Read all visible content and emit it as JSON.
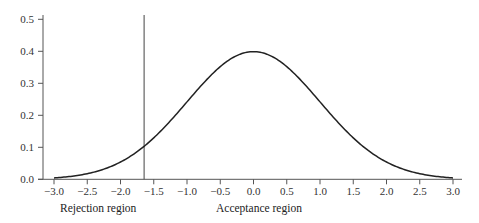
{
  "chart_data": {
    "type": "line",
    "title": "",
    "xlabel": "",
    "ylabel": "",
    "series": [
      {
        "name": "Standard normal pdf",
        "function": "exp(-x^2/2)/sqrt(2*pi)",
        "x_range": [
          -3.0,
          3.0
        ],
        "sample_points": [
          {
            "x": -3.0,
            "y": 0.004
          },
          {
            "x": -2.5,
            "y": 0.018
          },
          {
            "x": -2.0,
            "y": 0.054
          },
          {
            "x": -1.645,
            "y": 0.103
          },
          {
            "x": -1.5,
            "y": 0.13
          },
          {
            "x": -1.0,
            "y": 0.242
          },
          {
            "x": -0.5,
            "y": 0.352
          },
          {
            "x": 0.0,
            "y": 0.399
          },
          {
            "x": 0.5,
            "y": 0.352
          },
          {
            "x": 1.0,
            "y": 0.242
          },
          {
            "x": 1.5,
            "y": 0.13
          },
          {
            "x": 2.0,
            "y": 0.054
          },
          {
            "x": 2.5,
            "y": 0.018
          },
          {
            "x": 3.0,
            "y": 0.004
          }
        ]
      }
    ],
    "critical_value": -1.645,
    "x_ticks": [
      "-3.0",
      "-2.5",
      "-2.0",
      "-1.5",
      "-1.0",
      "-0.5",
      "0.0",
      "0.5",
      "1.0",
      "1.5",
      "2.0",
      "2.5",
      "3.0"
    ],
    "y_ticks": [
      "0.0",
      "0.1",
      "0.2",
      "0.3",
      "0.4",
      "0.5"
    ],
    "xlim": [
      -3.0,
      3.0
    ],
    "ylim": [
      0.0,
      0.5
    ],
    "grid": false,
    "legend": "none",
    "annotations": [
      {
        "text": "Rejection region",
        "position": "below x-axis, left of critical value"
      },
      {
        "text": "Acceptance region",
        "position": "below x-axis, right of critical value"
      }
    ]
  },
  "labels": {
    "rejection": "Rejection region",
    "acceptance": "Acceptance region"
  },
  "style": {
    "curve_color": "#222222",
    "axis_color": "#555555",
    "background": "#ffffff"
  }
}
